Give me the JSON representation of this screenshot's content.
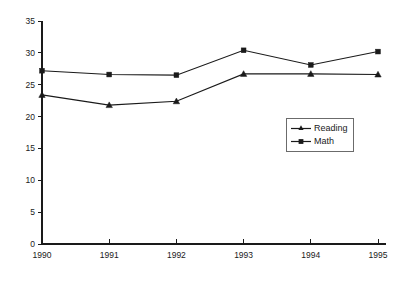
{
  "chart_data": {
    "type": "line",
    "title": "",
    "subtitle": "",
    "xlabel": "",
    "ylabel": "",
    "categories": [
      "1990",
      "1991",
      "1992",
      "1993",
      "1994",
      "1995"
    ],
    "x": [
      1990,
      1991,
      1992,
      1993,
      1994,
      1995
    ],
    "series": [
      {
        "name": "Reading",
        "marker": "triangle",
        "color": "#1a1a1a",
        "values": [
          23.4,
          21.8,
          22.4,
          26.7,
          26.7,
          26.6
        ]
      },
      {
        "name": "Math",
        "marker": "square",
        "color": "#1a1a1a",
        "values": [
          27.2,
          26.6,
          26.5,
          30.4,
          28.1,
          30.2
        ]
      }
    ],
    "ylim": [
      0,
      35
    ],
    "ytick_step": 5,
    "ytick_labels": [
      "0",
      "5",
      "10",
      "15",
      "20",
      "25",
      "30",
      "35"
    ],
    "ytick_values": [
      0,
      5,
      10,
      15,
      20,
      25,
      30,
      35
    ],
    "xtick_labels": [
      "1990",
      "1991",
      "1992",
      "1993",
      "1994",
      "1995"
    ],
    "grid": false,
    "legend_position": "inside-right",
    "legend_entries": [
      "Reading",
      "Math"
    ]
  },
  "legend": {
    "entries": [
      {
        "label": "Reading",
        "marker": "triangle"
      },
      {
        "label": "Math",
        "marker": "square"
      }
    ]
  },
  "colors": {
    "axis": "#1a1a1a",
    "series": "#1a1a1a",
    "legend_border": "#6b6b6b",
    "background": "#ffffff"
  }
}
